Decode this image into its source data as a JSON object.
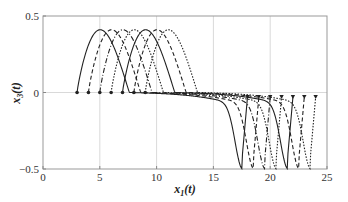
{
  "chart_data": {
    "type": "line",
    "title": "",
    "xlabel": "x_1(t)",
    "ylabel": "x_3(t)",
    "xlim": [
      0,
      25
    ],
    "ylim": [
      -0.5,
      0.5
    ],
    "xticks": [
      0,
      5,
      10,
      15,
      20,
      25
    ],
    "yticks": [
      -0.5,
      0,
      0.5
    ],
    "xtick_labels": [
      "0",
      "5",
      "10",
      "15",
      "20",
      "25"
    ],
    "ytick_labels": [
      "−0.5",
      "0",
      "0.5"
    ],
    "grid": {
      "vertical": [
        5,
        10,
        15,
        20
      ],
      "horizontal": [
        0
      ]
    },
    "legend": null,
    "series": [
      {
        "name": "trajectory 1",
        "style": "solid",
        "start_x": 3,
        "end_x": 18,
        "peak": 0.41,
        "trough": -0.41,
        "end_y": -0.03
      },
      {
        "name": "trajectory 2",
        "style": "dashed",
        "start_x": 4,
        "end_x": 19,
        "peak": 0.41,
        "trough": -0.41,
        "end_y": -0.03
      },
      {
        "name": "trajectory 3",
        "style": "dashdot",
        "start_x": 5,
        "end_x": 20,
        "peak": 0.41,
        "trough": -0.41,
        "end_y": -0.03
      },
      {
        "name": "trajectory 4",
        "style": "dotted",
        "start_x": 6,
        "end_x": 21,
        "peak": 0.41,
        "trough": -0.41,
        "end_y": -0.03
      },
      {
        "name": "trajectory 5",
        "style": "solid",
        "start_x": 7,
        "end_x": 22,
        "peak": 0.41,
        "trough": -0.41,
        "end_y": -0.03
      },
      {
        "name": "trajectory 6",
        "style": "dashed",
        "start_x": 8,
        "end_x": 23,
        "peak": 0.41,
        "trough": -0.41,
        "end_y": -0.03
      },
      {
        "name": "trajectory 7",
        "style": "dotted",
        "start_x": 9,
        "end_x": 24,
        "peak": 0.41,
        "trough": -0.41,
        "end_y": -0.03
      }
    ],
    "markers": {
      "start": "circle",
      "end": "triangle-down"
    }
  },
  "colors": {
    "line": "#222222",
    "grid": "#cfcfcf",
    "axis": "#888888"
  }
}
